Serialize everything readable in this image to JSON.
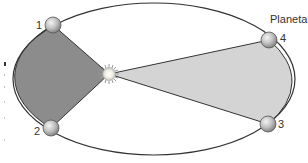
{
  "diagram": {
    "title_label": "Planeta",
    "orbit": {
      "cx": 154,
      "cy": 79,
      "rx": 141,
      "ry": 76,
      "stroke": "#333333"
    },
    "sun": {
      "cx": 109,
      "cy": 74,
      "r": 7
    },
    "sectors": [
      {
        "id": "sector-1-2",
        "from": "1",
        "to": "2",
        "fill": "#8c8c8c"
      },
      {
        "id": "sector-3-4",
        "from": "3",
        "to": "4",
        "fill": "#d4d4d4"
      }
    ],
    "planets": [
      {
        "label": "1",
        "cx": 53,
        "cy": 25
      },
      {
        "label": "2",
        "cx": 51,
        "cy": 128
      },
      {
        "label": "3",
        "cx": 268,
        "cy": 124
      },
      {
        "label": "4",
        "cx": 269,
        "cy": 40
      }
    ]
  },
  "colors": {
    "dark_sector": "#8c8c8c",
    "light_sector": "#d4d4d4",
    "outline": "#333333",
    "planet_highlight": "#f2f2f2",
    "planet_shadow": "#8a8a8a",
    "sun_core": "#fffbe6",
    "sun_rays": "#9a9a9a"
  }
}
